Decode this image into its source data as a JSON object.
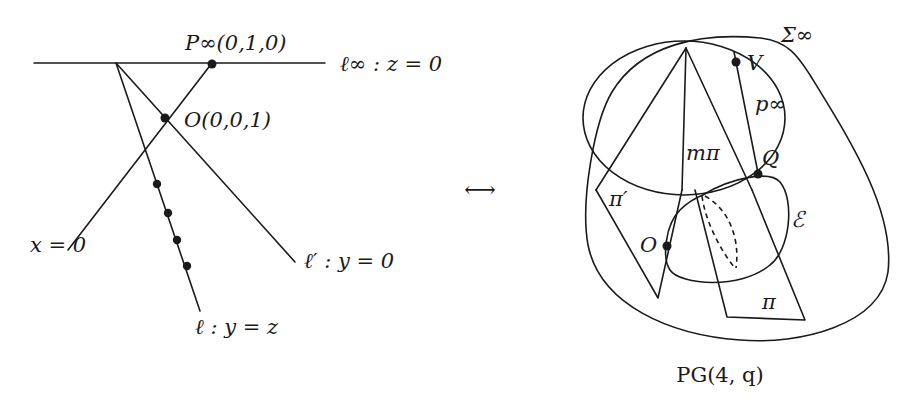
{
  "figure": {
    "left_panel": {
      "lines": {
        "line_at_infinity": "ℓ∞ : z = 0",
        "line_x0": "x = 0",
        "line_l_prime": "ℓ′ : y = 0",
        "line_l": "ℓ : y = z"
      },
      "points": {
        "p_infinity": "P∞(0,1,0)",
        "origin": "O(0,0,1)"
      },
      "dot_count_on_l": 4
    },
    "correspondence_symbol": "⟷",
    "right_panel": {
      "labels": {
        "sigma_infinity": "Σ∞",
        "vertex": "V",
        "p_infinity": "p∞",
        "m_pi": "mπ",
        "point_q": "Q",
        "pi_prime": "π′",
        "ellipsoid": "ℰ",
        "origin": "O",
        "pi": "π"
      },
      "space_label": "PG(4, q)"
    }
  }
}
